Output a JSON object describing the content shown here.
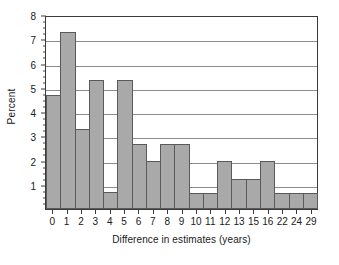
{
  "chart_data": {
    "type": "bar",
    "title": "",
    "subtitle": "",
    "xlabel": "Difference in estimates (years)",
    "ylabel": "Percent",
    "categories": [
      "0",
      "1",
      "2",
      "3",
      "4",
      "5",
      "6",
      "7",
      "8",
      "9",
      "10",
      "11",
      "12",
      "13",
      "15",
      "16",
      "22",
      "24",
      "29"
    ],
    "values": [
      4.7,
      7.3,
      3.3,
      5.3,
      0.7,
      5.3,
      2.7,
      2.0,
      2.7,
      2.7,
      0.65,
      0.65,
      2.0,
      1.25,
      1.25,
      2.0,
      0.65,
      0.65,
      0.65
    ],
    "ylim": [
      0,
      8
    ],
    "xlim_note": "categorical histogram bins, contiguous bars",
    "yticks": [
      1,
      2,
      3,
      4,
      5,
      6,
      7,
      8
    ],
    "ytick_labels": [
      "1",
      "2",
      "3",
      "4",
      "5",
      "6",
      "7",
      "8"
    ],
    "yminor_step": 0.25,
    "grid": true,
    "grid_axis": "y",
    "legend": null,
    "legend_position": "none",
    "series": [
      {
        "name": "Percent",
        "values": [
          4.7,
          7.3,
          3.3,
          5.3,
          0.7,
          5.3,
          2.7,
          2.0,
          2.7,
          2.7,
          0.65,
          0.65,
          2.0,
          1.25,
          1.25,
          2.0,
          0.65,
          0.65,
          0.65
        ]
      }
    ],
    "colors": {
      "bar_fill": "#a9a9a9",
      "bar_edge": "#5a5a5a",
      "gridline": "#8c8c8c",
      "axis": "#3a3a3a",
      "text": "#1a1a1a",
      "background": "#ffffff"
    }
  }
}
